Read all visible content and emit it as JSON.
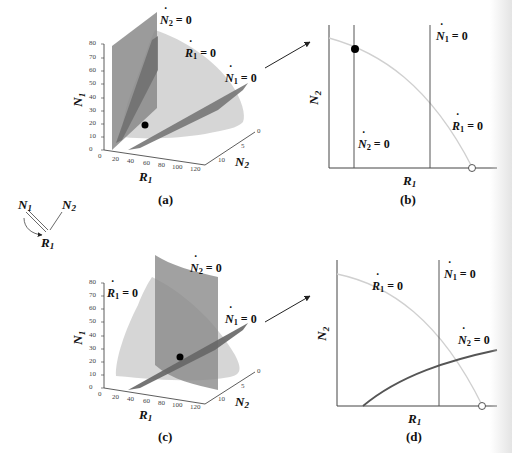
{
  "figure": {
    "colors": {
      "axis": "#333333",
      "r1_surface": "#d4d4d4",
      "n2_plane": "#8a8a8a",
      "n1_plane": "#7a7a7a",
      "r1_curve_2d": "#cfcfcf",
      "isocline_2d": "#555555",
      "n2_curve_2d": "#555555",
      "point": "#000000"
    },
    "network": {
      "nodes": [
        "N1",
        "N2",
        "R1"
      ],
      "labels": {
        "n1": "N",
        "n1_sub": "1",
        "n2": "N",
        "n2_sub": "2",
        "r1": "R",
        "r1_sub": "1"
      },
      "edges": [
        [
          "N1",
          "R1"
        ],
        [
          "N2",
          "R1"
        ]
      ],
      "feedback_arrow": "N1 → R1"
    },
    "panels": [
      {
        "id": "a",
        "caption": "(a)",
        "type": "3d-surfaces",
        "axes": {
          "z_label": "N",
          "z_sub": "1",
          "x_label": "R",
          "x_sub": "1",
          "y_label": "N",
          "y_sub": "2",
          "z_ticks": [
            "0",
            "10",
            "20",
            "30",
            "40",
            "50",
            "60",
            "70",
            "80"
          ],
          "x_ticks": [
            "0",
            "20",
            "40",
            "60",
            "80",
            "100",
            "120"
          ],
          "y_ticks": [
            "0",
            "5",
            "10"
          ]
        },
        "labels": {
          "n2": {
            "sym": "N",
            "sub": "2",
            "eq": " = 0"
          },
          "r1": {
            "sym": "R",
            "sub": "1",
            "eq": " = 0"
          },
          "n1": {
            "sym": "N",
            "sub": "1",
            "eq": " = 0"
          }
        },
        "equilibrium": "filled-dot"
      },
      {
        "id": "b",
        "caption": "(b)",
        "type": "2d-projection",
        "axes": {
          "x_label": "R",
          "x_sub": "1",
          "y_label": "N",
          "y_sub": "2"
        },
        "labels": {
          "n1": {
            "sym": "N",
            "sub": "1",
            "eq": " = 0"
          },
          "r1": {
            "sym": "R",
            "sub": "1",
            "eq": " = 0"
          },
          "n2": {
            "sym": "N",
            "sub": "2",
            "eq": " = 0"
          }
        },
        "markers": [
          "filled-dot at N2 isocline / R1 curve",
          "open-circle at R1 curve / R1 axis"
        ]
      },
      {
        "id": "c",
        "caption": "(c)",
        "type": "3d-surfaces",
        "axes": {
          "z_label": "N",
          "z_sub": "1",
          "x_label": "R",
          "x_sub": "1",
          "y_label": "N",
          "y_sub": "2",
          "z_ticks": [
            "0",
            "10",
            "20",
            "30",
            "40",
            "50",
            "60",
            "70",
            "80"
          ],
          "x_ticks": [
            "0",
            "20",
            "40",
            "60",
            "80",
            "100",
            "120"
          ],
          "y_ticks": [
            "0",
            "5",
            "10"
          ]
        },
        "labels": {
          "r1": {
            "sym": "R",
            "sub": "1",
            "eq": " = 0"
          },
          "n2": {
            "sym": "N",
            "sub": "2",
            "eq": " = 0"
          },
          "n1": {
            "sym": "N",
            "sub": "1",
            "eq": " = 0"
          }
        },
        "equilibrium": "filled-dot"
      },
      {
        "id": "d",
        "caption": "(d)",
        "type": "2d-projection",
        "axes": {
          "x_label": "R",
          "x_sub": "1",
          "y_label": "N",
          "y_sub": "2"
        },
        "labels": {
          "r1": {
            "sym": "R",
            "sub": "1",
            "eq": " = 0"
          },
          "n1": {
            "sym": "N",
            "sub": "1",
            "eq": " = 0"
          },
          "n2": {
            "sym": "N",
            "sub": "2",
            "eq": " = 0"
          }
        },
        "markers": [
          "open-circle at R1 curve / R1 axis"
        ]
      }
    ]
  }
}
